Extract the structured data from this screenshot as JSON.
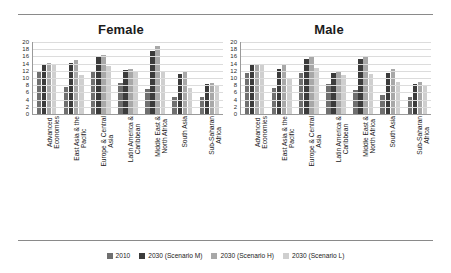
{
  "figure": {
    "panels": [
      {
        "title": "Female"
      },
      {
        "title": "Male"
      }
    ]
  },
  "legend": {
    "position": "bottom-center",
    "items": [
      {
        "label": "2010",
        "color": "#6f6f6f"
      },
      {
        "label": "2030 (Scenario M)",
        "color": "#3b3b3b"
      },
      {
        "label": "2030 (Scenario H)",
        "color": "#a8a8a8"
      },
      {
        "label": "2030 (Scenario L)",
        "color": "#cfcfcf"
      }
    ]
  },
  "chart_data": [
    {
      "type": "bar",
      "title": "Female",
      "xlabel": "",
      "ylabel": "",
      "ylim": [
        0,
        20
      ],
      "yticks": [
        0,
        2,
        4,
        6,
        8,
        10,
        12,
        14,
        16,
        18,
        20
      ],
      "grid": true,
      "categories": [
        "Advanced Economies",
        "East Asia & the Pacific",
        "Europe & Central Asia",
        "Latin America & Caribbean",
        "Middle East & North Africa",
        "South Asia",
        "Sub-Saharan Africa"
      ],
      "series": [
        {
          "name": "2010",
          "color": "#6f6f6f",
          "values": [
            11.8,
            7.6,
            11.7,
            8.6,
            6.9,
            4.6,
            4.6
          ]
        },
        {
          "name": "2030 (Scenario M)",
          "color": "#3b3b3b",
          "values": [
            14.0,
            14.3,
            15.8,
            12.3,
            17.4,
            11.2,
            8.4
          ]
        },
        {
          "name": "2030 (Scenario H)",
          "color": "#a8a8a8",
          "values": [
            14.1,
            15.0,
            16.3,
            12.6,
            19.0,
            12.0,
            8.6
          ]
        },
        {
          "name": "2030 (Scenario L)",
          "color": "#cfcfcf",
          "values": [
            14.0,
            10.8,
            13.3,
            11.6,
            11.9,
            7.1,
            7.7
          ]
        }
      ]
    },
    {
      "type": "bar",
      "title": "Male",
      "xlabel": "",
      "ylabel": "",
      "ylim": [
        0,
        20
      ],
      "yticks": [
        0,
        2,
        4,
        6,
        8,
        10,
        12,
        14,
        16,
        18,
        20
      ],
      "grid": true,
      "categories": [
        "Advanced Economies",
        "East Asia & the Pacific",
        "Europe & Central Asia",
        "Latin America & Caribbean",
        "Middle East & North Africa",
        "South Asia",
        "Sub-Saharan Africa"
      ],
      "series": [
        {
          "name": "2010",
          "color": "#6f6f6f",
          "values": [
            11.5,
            7.3,
            11.5,
            8.2,
            6.6,
            5.2,
            4.8
          ]
        },
        {
          "name": "2030 (Scenario M)",
          "color": "#3b3b3b",
          "values": [
            13.7,
            12.6,
            15.2,
            11.5,
            15.3,
            11.5,
            8.4
          ]
        },
        {
          "name": "2030 (Scenario H)",
          "color": "#a8a8a8",
          "values": [
            14.0,
            13.6,
            15.7,
            12.0,
            16.1,
            12.4,
            8.8
          ]
        },
        {
          "name": "2030 (Scenario L)",
          "color": "#cfcfcf",
          "values": [
            13.5,
            9.9,
            12.9,
            10.9,
            11.0,
            9.0,
            7.9
          ]
        }
      ]
    }
  ]
}
